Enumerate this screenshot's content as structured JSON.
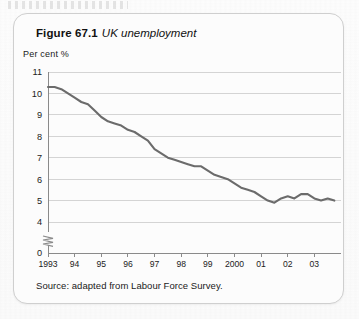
{
  "figure": {
    "label": "Figure 67.1",
    "caption": "UK unemployment",
    "source_note": "Source: adapted from Labour Force Survey."
  },
  "axis": {
    "y_label": "Per cent %",
    "y_ticks": [
      "11",
      "10",
      "9",
      "8",
      "7",
      "6",
      "5",
      "4",
      "0"
    ],
    "x_ticks": [
      "1993",
      "94",
      "95",
      "96",
      "97",
      "98",
      "99",
      "2000",
      "01",
      "02",
      "03"
    ],
    "break_marker": "axis-break-zigzag"
  },
  "colors": {
    "line": "#6b6b6b",
    "grid": "#c9c9c9",
    "axis": "#8a8a8a",
    "card_border": "#cfcfcf",
    "text": "#1a1a1a"
  },
  "chart_data": {
    "type": "line",
    "title": "UK unemployment",
    "xlabel": "",
    "ylabel": "Per cent %",
    "ylim": [
      4,
      11
    ],
    "y_axis_break_to": 0,
    "grid": true,
    "legend": "none",
    "x_tick_labels": [
      "1993",
      "94",
      "95",
      "96",
      "97",
      "98",
      "99",
      "2000",
      "01",
      "02",
      "03"
    ],
    "x_tick_years": [
      1993,
      1994,
      1995,
      1996,
      1997,
      1998,
      1999,
      2000,
      2001,
      2002,
      2003
    ],
    "series": [
      {
        "name": "UK unemployment rate",
        "units": "per cent",
        "x": [
          1993.0,
          1993.25,
          1993.5,
          1993.75,
          1994.0,
          1994.25,
          1994.5,
          1994.75,
          1995.0,
          1995.25,
          1995.5,
          1995.75,
          1996.0,
          1996.25,
          1996.5,
          1996.75,
          1997.0,
          1997.25,
          1997.5,
          1997.75,
          1998.0,
          1998.25,
          1998.5,
          1998.75,
          1999.0,
          1999.25,
          1999.5,
          1999.75,
          2000.0,
          2000.25,
          2000.5,
          2000.75,
          2001.0,
          2001.25,
          2001.5,
          2001.75,
          2002.0,
          2002.25,
          2002.5,
          2002.75,
          2003.0,
          2003.25,
          2003.5,
          2003.75
        ],
        "values": [
          10.3,
          10.3,
          10.2,
          10.0,
          9.8,
          9.6,
          9.5,
          9.2,
          8.9,
          8.7,
          8.6,
          8.5,
          8.3,
          8.2,
          8.0,
          7.8,
          7.4,
          7.2,
          7.0,
          6.9,
          6.8,
          6.7,
          6.6,
          6.6,
          6.4,
          6.2,
          6.1,
          6.0,
          5.8,
          5.6,
          5.5,
          5.4,
          5.2,
          5.0,
          4.9,
          5.1,
          5.2,
          5.1,
          5.3,
          5.3,
          5.1,
          5.0,
          5.1,
          5.0
        ]
      }
    ],
    "annotations": [
      {
        "text": "Per cent %",
        "role": "y-axis-unit"
      },
      {
        "text": "Source: adapted from Labour Force Survey.",
        "role": "source"
      }
    ]
  }
}
